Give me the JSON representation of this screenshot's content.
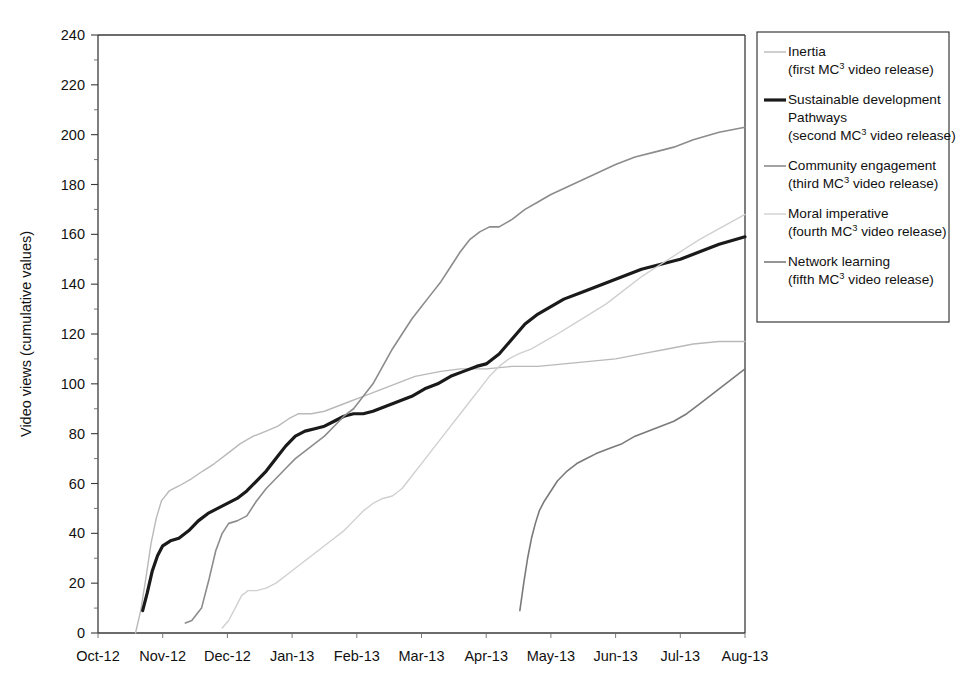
{
  "chart_data": {
    "type": "line",
    "title": "",
    "xlabel": "",
    "ylabel": "Video views (cumulative values)",
    "ylim": [
      0,
      240
    ],
    "ytick_step": 20,
    "yticks": [
      0,
      20,
      40,
      60,
      80,
      100,
      120,
      140,
      160,
      180,
      200,
      220,
      240
    ],
    "minor_tick_step": 10,
    "grid": false,
    "legend_position": "right",
    "x_categories": [
      "Oct-12",
      "Nov-12",
      "Dec-12",
      "Jan-13",
      "Feb-13",
      "Mar-13",
      "Apr-13",
      "May-13",
      "Jun-13",
      "Jul-13",
      "Aug-13"
    ],
    "x_axis_note": "Monthly tick labels; data sampled at roughly half-month resolution",
    "series": [
      {
        "name": "Inertia",
        "sublabel": "(first MC3 video release)",
        "sublabel_prefix": "(first MC",
        "sublabel_sup": "3",
        "sublabel_suffix": " video release)",
        "color": "#b9b9b9",
        "width": 1.4,
        "start_x": 0.58,
        "points": [
          [
            0.58,
            0
          ],
          [
            0.66,
            9
          ],
          [
            0.74,
            22
          ],
          [
            0.82,
            36
          ],
          [
            0.9,
            46
          ],
          [
            0.98,
            53
          ],
          [
            1.1,
            57
          ],
          [
            1.25,
            59
          ],
          [
            1.45,
            62
          ],
          [
            1.62,
            65
          ],
          [
            1.8,
            68
          ],
          [
            2.0,
            72
          ],
          [
            2.2,
            76
          ],
          [
            2.4,
            79
          ],
          [
            2.6,
            81
          ],
          [
            2.78,
            83
          ],
          [
            2.95,
            86
          ],
          [
            3.1,
            88
          ],
          [
            3.3,
            88
          ],
          [
            3.5,
            89
          ],
          [
            3.7,
            91
          ],
          [
            3.9,
            93
          ],
          [
            4.1,
            95
          ],
          [
            4.3,
            97
          ],
          [
            4.5,
            99
          ],
          [
            4.7,
            101
          ],
          [
            4.9,
            103
          ],
          [
            5.1,
            104
          ],
          [
            5.3,
            105
          ],
          [
            5.6,
            106
          ],
          [
            6.0,
            106
          ],
          [
            6.4,
            107
          ],
          [
            6.8,
            107
          ],
          [
            7.2,
            108
          ],
          [
            7.6,
            109
          ],
          [
            8.0,
            110
          ],
          [
            8.4,
            112
          ],
          [
            8.8,
            114
          ],
          [
            9.2,
            116
          ],
          [
            9.6,
            117
          ],
          [
            10.0,
            117
          ]
        ]
      },
      {
        "name": "Sustainable development Pathways",
        "name_line1": "Sustainable development",
        "name_line2": "Pathways",
        "sublabel": "(second MC3 video release)",
        "sublabel_prefix": "(second MC",
        "sublabel_sup": "3",
        "sublabel_suffix": " video release)",
        "color": "#1a1a1a",
        "width": 3.2,
        "start_x": 0.69,
        "points": [
          [
            0.69,
            9
          ],
          [
            0.76,
            16
          ],
          [
            0.84,
            25
          ],
          [
            0.92,
            31
          ],
          [
            1.0,
            35
          ],
          [
            1.12,
            37
          ],
          [
            1.25,
            38
          ],
          [
            1.4,
            41
          ],
          [
            1.55,
            45
          ],
          [
            1.7,
            48
          ],
          [
            1.85,
            50
          ],
          [
            2.0,
            52
          ],
          [
            2.15,
            54
          ],
          [
            2.3,
            57
          ],
          [
            2.45,
            61
          ],
          [
            2.6,
            65
          ],
          [
            2.75,
            70
          ],
          [
            2.9,
            75
          ],
          [
            3.05,
            79
          ],
          [
            3.2,
            81
          ],
          [
            3.35,
            82
          ],
          [
            3.5,
            83
          ],
          [
            3.65,
            85
          ],
          [
            3.8,
            87
          ],
          [
            3.95,
            88
          ],
          [
            4.1,
            88
          ],
          [
            4.25,
            89
          ],
          [
            4.45,
            91
          ],
          [
            4.65,
            93
          ],
          [
            4.85,
            95
          ],
          [
            5.05,
            98
          ],
          [
            5.25,
            100
          ],
          [
            5.45,
            103
          ],
          [
            5.65,
            105
          ],
          [
            5.85,
            107
          ],
          [
            6.0,
            108
          ],
          [
            6.2,
            112
          ],
          [
            6.4,
            118
          ],
          [
            6.6,
            124
          ],
          [
            6.8,
            128
          ],
          [
            7.0,
            131
          ],
          [
            7.2,
            134
          ],
          [
            7.5,
            137
          ],
          [
            7.8,
            140
          ],
          [
            8.1,
            143
          ],
          [
            8.4,
            146
          ],
          [
            8.7,
            148
          ],
          [
            9.0,
            150
          ],
          [
            9.3,
            153
          ],
          [
            9.6,
            156
          ],
          [
            10.0,
            159
          ]
        ]
      },
      {
        "name": "Community engagement",
        "sublabel": "(third MC3 video release)",
        "sublabel_prefix": "(third MC",
        "sublabel_sup": "3",
        "sublabel_suffix": " video release)",
        "color": "#8c8c8c",
        "width": 1.6,
        "start_x": 1.35,
        "points": [
          [
            1.35,
            4
          ],
          [
            1.45,
            5
          ],
          [
            1.6,
            10
          ],
          [
            1.72,
            22
          ],
          [
            1.82,
            33
          ],
          [
            1.92,
            40
          ],
          [
            2.02,
            44
          ],
          [
            2.15,
            45
          ],
          [
            2.3,
            47
          ],
          [
            2.45,
            53
          ],
          [
            2.6,
            58
          ],
          [
            2.75,
            62
          ],
          [
            2.9,
            66
          ],
          [
            3.05,
            70
          ],
          [
            3.2,
            73
          ],
          [
            3.35,
            76
          ],
          [
            3.5,
            79
          ],
          [
            3.65,
            83
          ],
          [
            3.8,
            87
          ],
          [
            3.95,
            90
          ],
          [
            4.1,
            95
          ],
          [
            4.25,
            100
          ],
          [
            4.4,
            107
          ],
          [
            4.55,
            114
          ],
          [
            4.7,
            120
          ],
          [
            4.85,
            126
          ],
          [
            5.0,
            131
          ],
          [
            5.15,
            136
          ],
          [
            5.3,
            141
          ],
          [
            5.45,
            147
          ],
          [
            5.6,
            153
          ],
          [
            5.75,
            158
          ],
          [
            5.9,
            161
          ],
          [
            6.05,
            163
          ],
          [
            6.2,
            163
          ],
          [
            6.4,
            166
          ],
          [
            6.6,
            170
          ],
          [
            6.8,
            173
          ],
          [
            7.0,
            176
          ],
          [
            7.25,
            179
          ],
          [
            7.5,
            182
          ],
          [
            7.75,
            185
          ],
          [
            8.0,
            188
          ],
          [
            8.3,
            191
          ],
          [
            8.6,
            193
          ],
          [
            8.9,
            195
          ],
          [
            9.2,
            198
          ],
          [
            9.6,
            201
          ],
          [
            10.0,
            203
          ]
        ]
      },
      {
        "name": "Moral imperative",
        "sublabel": "(fourth MC3 video release)",
        "sublabel_prefix": "(fourth MC",
        "sublabel_sup": "3",
        "sublabel_suffix": " video release)",
        "color": "#d0d0d0",
        "width": 1.4,
        "start_x": 1.92,
        "points": [
          [
            1.92,
            2
          ],
          [
            2.02,
            5
          ],
          [
            2.12,
            10
          ],
          [
            2.22,
            15
          ],
          [
            2.32,
            17
          ],
          [
            2.45,
            17
          ],
          [
            2.6,
            18
          ],
          [
            2.75,
            20
          ],
          [
            2.9,
            23
          ],
          [
            3.05,
            26
          ],
          [
            3.2,
            29
          ],
          [
            3.35,
            32
          ],
          [
            3.5,
            35
          ],
          [
            3.65,
            38
          ],
          [
            3.8,
            41
          ],
          [
            3.95,
            45
          ],
          [
            4.1,
            49
          ],
          [
            4.25,
            52
          ],
          [
            4.4,
            54
          ],
          [
            4.55,
            55
          ],
          [
            4.7,
            58
          ],
          [
            4.85,
            63
          ],
          [
            5.0,
            68
          ],
          [
            5.15,
            73
          ],
          [
            5.3,
            78
          ],
          [
            5.45,
            83
          ],
          [
            5.6,
            88
          ],
          [
            5.75,
            93
          ],
          [
            5.9,
            98
          ],
          [
            6.05,
            103
          ],
          [
            6.2,
            107
          ],
          [
            6.35,
            110
          ],
          [
            6.5,
            112
          ],
          [
            6.7,
            114
          ],
          [
            6.9,
            117
          ],
          [
            7.1,
            120
          ],
          [
            7.35,
            124
          ],
          [
            7.6,
            128
          ],
          [
            7.85,
            132
          ],
          [
            8.1,
            137
          ],
          [
            8.4,
            143
          ],
          [
            8.7,
            148
          ],
          [
            9.0,
            153
          ],
          [
            9.3,
            158
          ],
          [
            9.65,
            163
          ],
          [
            10.0,
            168
          ]
        ]
      },
      {
        "name": "Network learning",
        "sublabel": "(fifth MC3 video release)",
        "sublabel_prefix": "(fifth MC",
        "sublabel_sup": "3",
        "sublabel_suffix": " video release)",
        "color": "#7a7a7a",
        "width": 1.6,
        "start_x": 6.52,
        "points": [
          [
            6.52,
            9
          ],
          [
            6.58,
            20
          ],
          [
            6.64,
            30
          ],
          [
            6.7,
            38
          ],
          [
            6.76,
            44
          ],
          [
            6.82,
            49
          ],
          [
            6.9,
            53
          ],
          [
            7.0,
            57
          ],
          [
            7.1,
            61
          ],
          [
            7.25,
            65
          ],
          [
            7.4,
            68
          ],
          [
            7.55,
            70
          ],
          [
            7.7,
            72
          ],
          [
            7.9,
            74
          ],
          [
            8.1,
            76
          ],
          [
            8.3,
            79
          ],
          [
            8.5,
            81
          ],
          [
            8.7,
            83
          ],
          [
            8.9,
            85
          ],
          [
            9.1,
            88
          ],
          [
            9.3,
            92
          ],
          [
            9.5,
            96
          ],
          [
            9.7,
            100
          ],
          [
            9.85,
            103
          ],
          [
            10.0,
            106
          ]
        ]
      }
    ]
  },
  "axis": {
    "y_title": "Video views (cumulative values)",
    "y_ticklabels": [
      "0",
      "20",
      "40",
      "60",
      "80",
      "100",
      "120",
      "140",
      "160",
      "180",
      "200",
      "220",
      "240"
    ],
    "x_ticklabels": [
      "Oct-12",
      "Nov-12",
      "Dec-12",
      "Jan-13",
      "Feb-13",
      "Mar-13",
      "Apr-13",
      "May-13",
      "Jun-13",
      "Jul-13",
      "Aug-13"
    ]
  },
  "legend": {
    "entries": [
      {
        "label": "Inertia",
        "label_line2": "",
        "sub_prefix": "(first MC",
        "sub_sup": "3",
        "sub_suffix": " video release)",
        "color": "#b9b9b9",
        "width": 1.4
      },
      {
        "label": "Sustainable development",
        "label_line2": "Pathways",
        "sub_prefix": "(second MC",
        "sub_sup": "3",
        "sub_suffix": " video release)",
        "color": "#1a1a1a",
        "width": 3.2
      },
      {
        "label": "Community engagement",
        "label_line2": "",
        "sub_prefix": "(third MC",
        "sub_sup": "3",
        "sub_suffix": " video release)",
        "color": "#8c8c8c",
        "width": 1.6
      },
      {
        "label": "Moral imperative",
        "label_line2": "",
        "sub_prefix": "(fourth MC",
        "sub_sup": "3",
        "sub_suffix": " video release)",
        "color": "#d0d0d0",
        "width": 1.4
      },
      {
        "label": "Network learning",
        "label_line2": "",
        "sub_prefix": "(fifth MC",
        "sub_sup": "3",
        "sub_suffix": " video release)",
        "color": "#7a7a7a",
        "width": 1.6
      }
    ]
  }
}
